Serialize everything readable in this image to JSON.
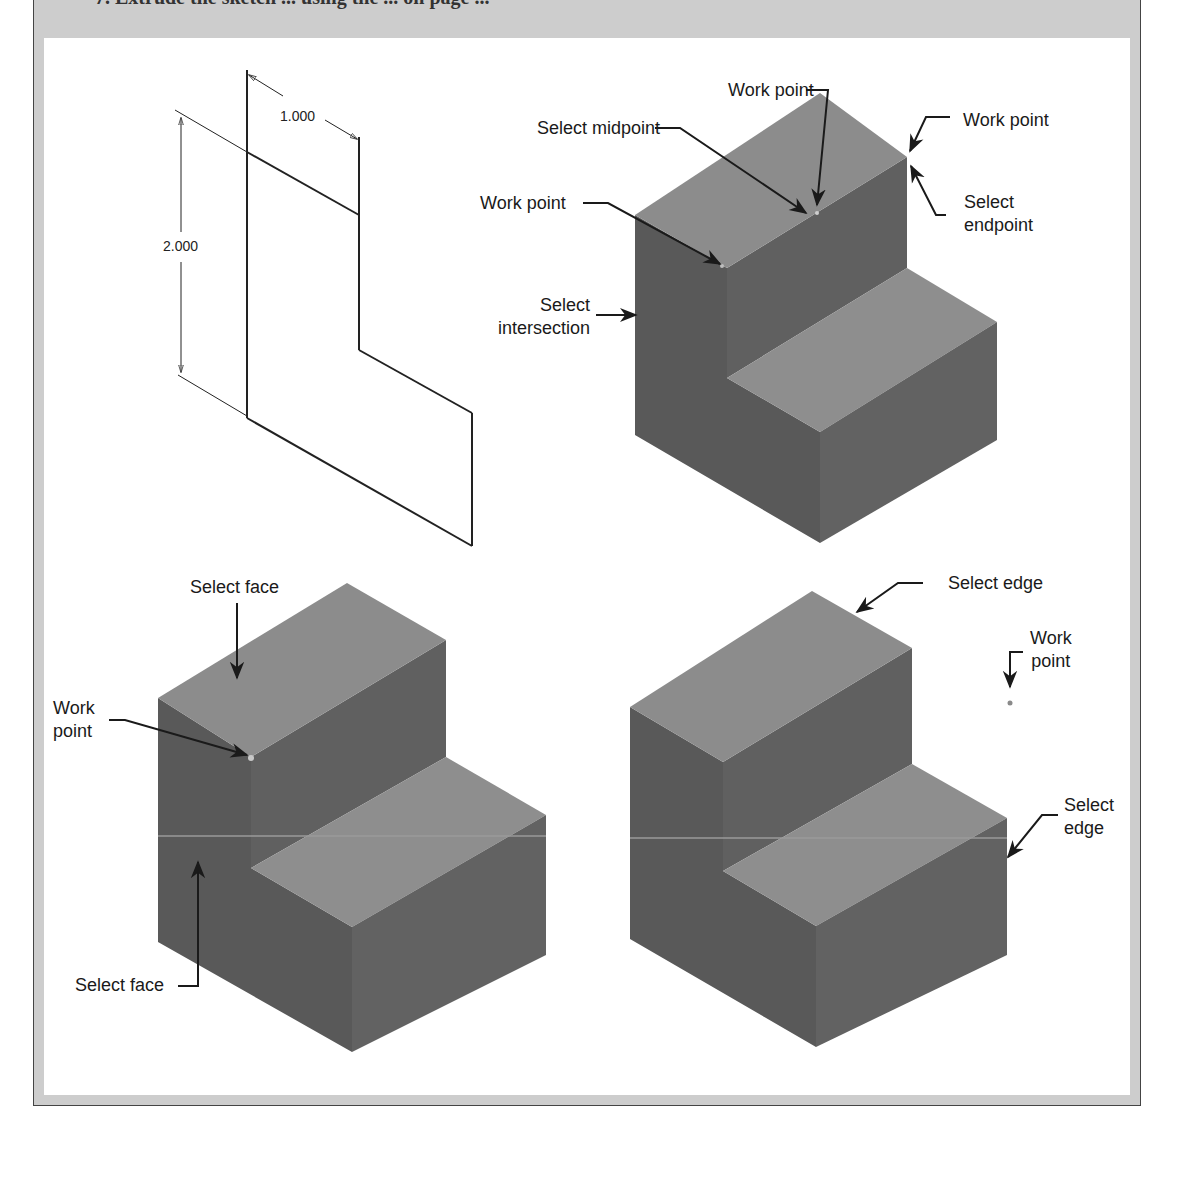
{
  "figure": {
    "header_text_cropped": "7. Extrude the sketch ... using the ... on page ...",
    "colors": {
      "frame_gray": "#cdcdcd",
      "panel_white": "#ffffff",
      "top_face": "#8c8c8c",
      "side_face": "#5f5f5f",
      "left_face": "#585858",
      "line": "#1a1a1a"
    },
    "sketch": {
      "dimension_horizontal": "1.000",
      "dimension_vertical": "2.000"
    },
    "top_right_view": {
      "labels": {
        "work_point_top": "Work point",
        "select_midpoint": "Select midpoint",
        "work_point_right": "Work point",
        "select_endpoint": "Select\nendpoint",
        "work_point_left": "Work point",
        "select_intersection": "Select\nintersection"
      }
    },
    "bottom_left_view": {
      "labels": {
        "select_face_top": "Select face",
        "work_point": "Work\npoint",
        "select_face_bottom": "Select face"
      }
    },
    "bottom_right_view": {
      "labels": {
        "select_edge_top": "Select edge",
        "work_point": "Work\npoint",
        "select_edge_right": "Select\nedge"
      }
    }
  }
}
